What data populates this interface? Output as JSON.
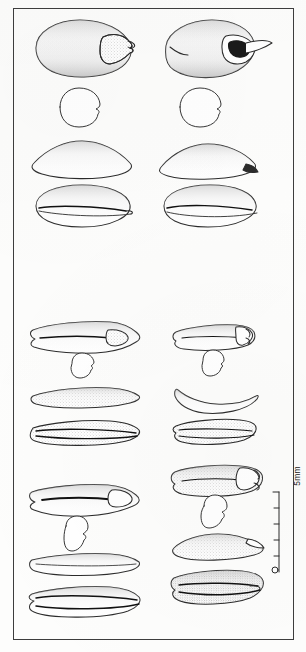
{
  "plate": {
    "kind": "scientific-illustration-plate",
    "medium": "ink line drawing, stippled shading",
    "background_color": "#fdfdfc",
    "ink_color": "#2b2b2b",
    "frame": {
      "present": true,
      "color": "#3d3d3d",
      "x": 13,
      "y": 8,
      "width": 281,
      "height": 632
    }
  },
  "scale_bar": {
    "label": "5mm",
    "orientation": "vertical",
    "ticks": 5,
    "zero_marker": "open-circle",
    "x": 277,
    "y_top": 492,
    "y_bottom": 574
  },
  "sections": [
    {
      "id": "section-upper",
      "name": "Upper specimen pair (rounded / broad seeds)",
      "columns": [
        {
          "id": "upper-left",
          "name": "Upper left specimen",
          "views": [
            {
              "id": "ventral",
              "label": "ventral view",
              "outline": "broad ovate, hilum notch at right"
            },
            {
              "id": "cross-section",
              "label": "transverse section",
              "outline": "reniform / kidney-shaped"
            },
            {
              "id": "lateral",
              "label": "lateral view",
              "outline": "lenticular, pointed right"
            },
            {
              "id": "dorsal",
              "label": "dorsal view",
              "outline": "broad ellipse with median groove"
            }
          ]
        },
        {
          "id": "upper-right",
          "name": "Upper right specimen",
          "views": [
            {
              "id": "ventral",
              "label": "ventral view",
              "outline": "broad ovate, prominent beaked hilum at right"
            },
            {
              "id": "cross-section",
              "label": "transverse section",
              "outline": "reniform with deep notch"
            },
            {
              "id": "lateral",
              "label": "lateral view",
              "outline": "lenticular, dark tip right"
            },
            {
              "id": "dorsal",
              "label": "dorsal view",
              "outline": "broad ellipse with median groove"
            }
          ]
        }
      ]
    },
    {
      "id": "section-lower",
      "name": "Lower specimen pairs (elongate grains)",
      "columns": [
        {
          "id": "mid-left",
          "name": "Middle left specimen",
          "views": [
            {
              "id": "ventral",
              "label": "ventral view",
              "outline": "elongate, pointed apex, median furrow"
            },
            {
              "id": "cross-section",
              "label": "transverse section",
              "outline": "small reniform"
            },
            {
              "id": "lateral",
              "label": "lateral view",
              "outline": "narrow lanceolate, stippled"
            },
            {
              "id": "dorsal",
              "label": "dorsal view",
              "outline": "elongate with twin ridges"
            }
          ]
        },
        {
          "id": "mid-right",
          "name": "Middle right specimen",
          "views": [
            {
              "id": "ventral",
              "label": "ventral view",
              "outline": "short elongate, truncate apex"
            },
            {
              "id": "cross-section",
              "label": "transverse section",
              "outline": "small reniform"
            },
            {
              "id": "lateral",
              "label": "lateral view",
              "outline": "crescent, concave dorsum"
            },
            {
              "id": "dorsal",
              "label": "dorsal view",
              "outline": "short elongate, split along suture"
            }
          ]
        },
        {
          "id": "low-left",
          "name": "Lower left specimen",
          "views": [
            {
              "id": "ventral",
              "label": "ventral view",
              "outline": "elongate, deep median groove, pale apex"
            },
            {
              "id": "cross-section",
              "label": "transverse section",
              "outline": "small reniform, upright"
            },
            {
              "id": "lateral",
              "label": "lateral view",
              "outline": "shallow lanceolate"
            },
            {
              "id": "dorsal",
              "label": "dorsal view",
              "outline": "elongate with twin ridges"
            }
          ]
        },
        {
          "id": "low-right",
          "name": "Lower right specimen",
          "views": [
            {
              "id": "ventral",
              "label": "ventral view",
              "outline": "broad elongate, truncate apex, median line"
            },
            {
              "id": "cross-section",
              "label": "transverse section",
              "outline": "small reniform"
            },
            {
              "id": "lateral",
              "label": "lateral view",
              "outline": "shallow boat shape"
            },
            {
              "id": "dorsal",
              "label": "dorsal view",
              "outline": "broad elongate with suture split"
            }
          ]
        }
      ]
    }
  ]
}
